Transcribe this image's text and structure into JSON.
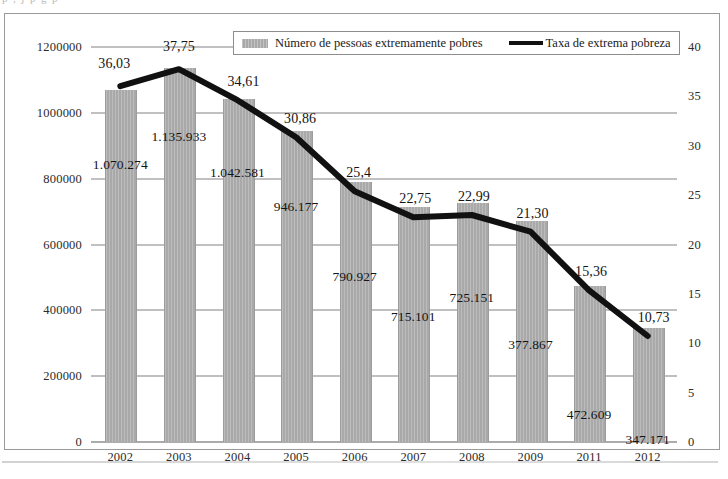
{
  "page": {
    "top_text_fragment": "p      ,      j      p      g      p"
  },
  "legend": {
    "bars_label": "Número de pessoas extremamente pobres",
    "line_label": "Taxa de extrema pobreza"
  },
  "axis": {
    "left_ticks": [
      "1200000",
      "1000000",
      "800000",
      "600000",
      "400000",
      "200000",
      "0"
    ],
    "right_ticks": [
      "40",
      "35",
      "30",
      "25",
      "20",
      "15",
      "10",
      "5",
      "0"
    ]
  },
  "chart_data": {
    "type": "bar",
    "title": "",
    "subtitle": "",
    "xlabel": "",
    "ylabel": "",
    "y2label": "",
    "grid": true,
    "legend_position": "top-center",
    "categories": [
      "2002",
      "2003",
      "2004",
      "2005",
      "2006",
      "2007",
      "2008",
      "2009",
      "2011",
      "2012"
    ],
    "ylim": [
      0,
      1200000
    ],
    "y2lim": [
      0,
      40
    ],
    "yticks": [
      0,
      200000,
      400000,
      600000,
      800000,
      1000000,
      1200000
    ],
    "y2ticks": [
      0,
      5,
      10,
      15,
      20,
      25,
      30,
      35,
      40
    ],
    "series": [
      {
        "name": "Número de pessoas extremamente pobres",
        "type": "bar",
        "axis": "left",
        "color": "#a9a9a9",
        "values": [
          1070274,
          1135933,
          1042581,
          946177,
          790927,
          715101,
          725151,
          670000,
          472609,
          347171
        ],
        "labels": [
          "1.070.274",
          "1.135.933",
          "1.042.581",
          "946.177",
          "790.927",
          "715.101",
          "725.151",
          "377.867",
          "472.609",
          "347.171"
        ]
      },
      {
        "name": "Taxa de extrema pobreza",
        "type": "line",
        "axis": "right",
        "color": "#111111",
        "values": [
          36.03,
          37.75,
          34.61,
          30.86,
          25.4,
          22.75,
          22.99,
          21.3,
          15.36,
          10.73
        ],
        "labels": [
          "36,03",
          "37,75",
          "34,61",
          "30,86",
          "25,4",
          "22,75",
          "22,99",
          "21,30",
          "15,36",
          "10,73"
        ]
      }
    ]
  }
}
